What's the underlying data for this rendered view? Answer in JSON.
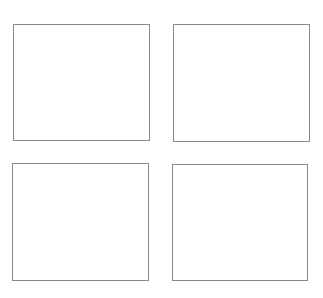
{
  "layout": "2x2 grid of empty panels",
  "panels": [
    {
      "id": "top-left",
      "label": ""
    },
    {
      "id": "top-right",
      "label": ""
    },
    {
      "id": "bottom-left",
      "label": ""
    },
    {
      "id": "bottom-right",
      "label": ""
    }
  ],
  "colors": {
    "border": "#8a8a8a",
    "background": "#ffffff"
  }
}
